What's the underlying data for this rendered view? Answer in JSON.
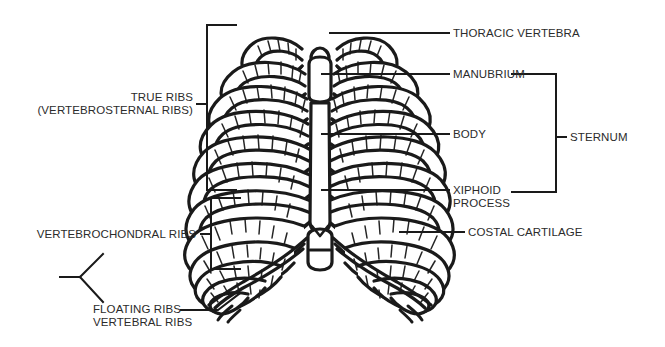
{
  "figure": {
    "background_color": "#ffffff",
    "ink_color": "#1a1a1a",
    "text_color": "#2b2b2b"
  },
  "labels": {
    "thoracic_vertebra": "THORACIC VERTEBRA",
    "manubrium": "MANUBRIUM",
    "body": "BODY",
    "xiphoid_line1": "XIPHOID",
    "xiphoid_line2": "PROCESS",
    "costal_cartilage": "COSTAL CARTILAGE",
    "sternum": "STERNUM",
    "true_ribs_line1": "TRUE RIBS",
    "true_ribs_line2": "(VERTEBROSTERNAL RIBS)",
    "vertebrochondral_ribs": "VERTEBROCHONDRAL RIBS",
    "floating_ribs": "FLOATING RIBS",
    "vertebral_ribs": "VERTEBRAL RIBS"
  },
  "structures": [
    {
      "name": "thoracic-vertebra",
      "side": "right",
      "group": "vertebral-column"
    },
    {
      "name": "manubrium",
      "side": "right",
      "group": "sternum"
    },
    {
      "name": "body",
      "side": "right",
      "group": "sternum"
    },
    {
      "name": "xiphoid-process",
      "side": "right",
      "group": "sternum"
    },
    {
      "name": "costal-cartilage",
      "side": "right",
      "group": "cartilage"
    },
    {
      "name": "true-ribs",
      "side": "left",
      "group": "ribs",
      "ribs": "1-7"
    },
    {
      "name": "vertebrochondral-ribs",
      "side": "left",
      "group": "ribs",
      "ribs": "8-10"
    },
    {
      "name": "floating-ribs",
      "side": "left",
      "group": "ribs",
      "ribs": "11-12"
    }
  ]
}
